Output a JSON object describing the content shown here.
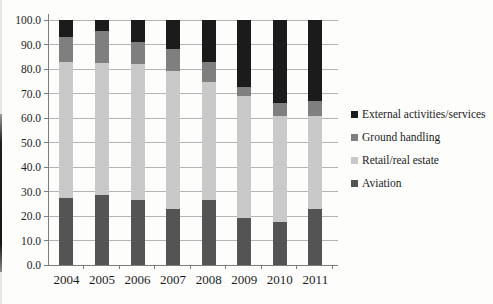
{
  "chart_data": {
    "type": "bar",
    "stacked": true,
    "title": "",
    "xlabel": "",
    "ylabel": "",
    "categories": [
      "2004",
      "2005",
      "2006",
      "2007",
      "2008",
      "2009",
      "2010",
      "2011"
    ],
    "series": [
      {
        "name": "External activities/services",
        "color": "#1b1b1b",
        "values": [
          7.0,
          4.5,
          9.0,
          12.0,
          17.0,
          27.5,
          34.0,
          33.0
        ]
      },
      {
        "name": "Ground handling",
        "color": "#7f7f7f",
        "values": [
          10.0,
          13.0,
          9.0,
          9.0,
          8.5,
          3.5,
          5.0,
          6.0
        ]
      },
      {
        "name": "Retail/real estate",
        "color": "#c9c9c9",
        "values": [
          55.5,
          54.0,
          55.5,
          56.0,
          48.0,
          50.0,
          43.5,
          38.0
        ]
      },
      {
        "name": "Aviation",
        "color": "#545454",
        "values": [
          27.5,
          28.5,
          26.5,
          23.0,
          26.5,
          19.0,
          17.5,
          23.0
        ]
      }
    ],
    "ylim": [
      0,
      100
    ],
    "ytick_step": 10,
    "ytick_labels": [
      "0.0",
      "10.0",
      "20.0",
      "30.0",
      "40.0",
      "50.0",
      "60.0",
      "70.0",
      "80.0",
      "90.0",
      "100.0"
    ],
    "grid": "horizontal",
    "legend_position": "right",
    "colors": {
      "gridline": "#b4b4b4",
      "axis": "#7d7d7d",
      "text": "#1c1c1c"
    }
  }
}
